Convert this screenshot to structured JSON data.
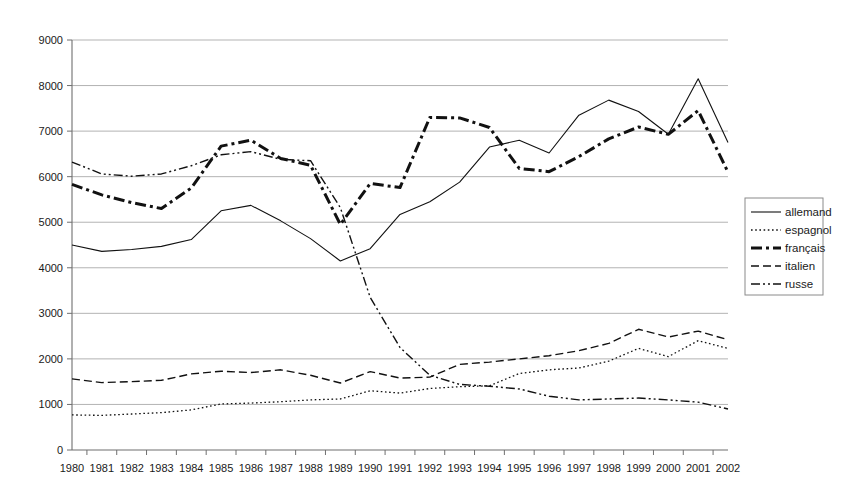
{
  "chart_data": {
    "type": "line",
    "title": "",
    "subtitle": "",
    "xlabel": "",
    "ylabel": "",
    "grid": true,
    "legend_position": "right",
    "xlim": [
      1980,
      2002
    ],
    "ylim": [
      0,
      9000
    ],
    "y_ticks": [
      0,
      1000,
      2000,
      3000,
      4000,
      5000,
      6000,
      7000,
      8000,
      9000
    ],
    "y_tick_labels": [
      "0",
      "1000",
      "2000",
      "3000",
      "4000",
      "5000",
      "6000",
      "7000",
      "8000",
      "9000"
    ],
    "categories": [
      1980,
      1981,
      1982,
      1983,
      1984,
      1985,
      1986,
      1987,
      1988,
      1989,
      1990,
      1991,
      1992,
      1993,
      1994,
      1995,
      1996,
      1997,
      1998,
      1999,
      2000,
      2001,
      2002
    ],
    "x_tick_labels": [
      "1980",
      "1981",
      "1982",
      "1983",
      "1984",
      "1985",
      "1986",
      "1987",
      "1988",
      "1989",
      "1990",
      "1991",
      "1992",
      "1993",
      "1994",
      "1995",
      "1996",
      "1997",
      "1998",
      "1999",
      "2000",
      "2001",
      "2002"
    ],
    "series": [
      {
        "name": "allemand",
        "style": "solid",
        "color": "#111111",
        "width": 1.1,
        "dash": "",
        "values": [
          4500,
          4360,
          4400,
          4470,
          4620,
          5250,
          5370,
          5030,
          4640,
          4150,
          4420,
          5170,
          5450,
          5880,
          6650,
          6800,
          6520,
          7350,
          7680,
          7430,
          6930,
          8150,
          6750
        ]
      },
      {
        "name": "espagnol",
        "style": "dotted",
        "color": "#111111",
        "width": 1.3,
        "dash": "1.6,2.6",
        "values": [
          770,
          760,
          790,
          820,
          880,
          1010,
          1030,
          1060,
          1100,
          1120,
          1300,
          1250,
          1350,
          1390,
          1410,
          1680,
          1760,
          1800,
          1950,
          2230,
          2050,
          2400,
          2230
        ]
      },
      {
        "name": "français",
        "style": "thick-dashdot",
        "color": "#111111",
        "width": 3.0,
        "dash": "11,4,3,4",
        "values": [
          5830,
          5600,
          5430,
          5300,
          5750,
          6670,
          6800,
          6400,
          6250,
          4950,
          5850,
          5760,
          7300,
          7290,
          7080,
          6180,
          6110,
          6440,
          6830,
          7090,
          6930,
          7450,
          6100
        ]
      },
      {
        "name": "italien",
        "style": "dashed",
        "color": "#111111",
        "width": 1.4,
        "dash": "8,4",
        "values": [
          1560,
          1480,
          1500,
          1530,
          1670,
          1730,
          1700,
          1760,
          1640,
          1470,
          1720,
          1580,
          1600,
          1880,
          1930,
          2000,
          2070,
          2180,
          2340,
          2650,
          2480,
          2610,
          2420
        ]
      },
      {
        "name": "russe",
        "style": "dashdotdot",
        "color": "#111111",
        "width": 1.4,
        "dash": "9,3,2,3,2,3",
        "values": [
          6320,
          6060,
          6010,
          6060,
          6240,
          6480,
          6550,
          6380,
          6350,
          5320,
          3350,
          2250,
          1640,
          1440,
          1400,
          1340,
          1180,
          1100,
          1120,
          1140,
          1100,
          1050,
          900
        ]
      }
    ]
  },
  "legend": {
    "items": [
      {
        "label": "allemand"
      },
      {
        "label": "espagnol"
      },
      {
        "label": "français"
      },
      {
        "label": "italien"
      },
      {
        "label": "russe"
      }
    ]
  }
}
